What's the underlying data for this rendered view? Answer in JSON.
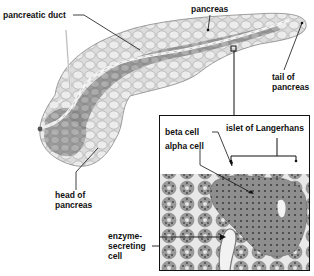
{
  "diagram": {
    "main_labels": {
      "pancreatic_duct": "pancreatic duct",
      "pancreas": "pancreas",
      "tail_line1": "tail of",
      "tail_line2": "pancreas",
      "head_line1": "head of",
      "head_line2": "pancreas"
    },
    "inset": {
      "islet": "islet of Langerhans",
      "beta_cell": "beta cell",
      "alpha_cell": "alpha cell",
      "enzyme_line1": "enzyme-",
      "enzyme_line2": "secreting",
      "enzyme_line3": "cell"
    },
    "colors": {
      "ink": "#111111",
      "organ_light": "#e2e2e2",
      "organ_dark": "#9a9a9a",
      "duct": "#f4f4f4",
      "tissue": "#8c8c8c"
    }
  }
}
